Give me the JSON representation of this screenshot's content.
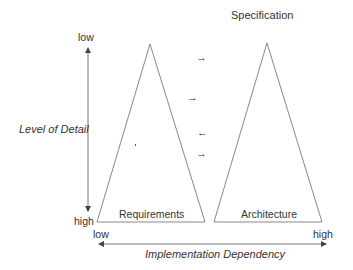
{
  "diagram": {
    "title": "Specification",
    "y_axis": {
      "label": "Level of Detail",
      "top_label": "low",
      "bottom_label": "high"
    },
    "x_axis": {
      "label": "Implementation Dependency",
      "left_label": "low",
      "right_label": "high"
    },
    "triangles": [
      {
        "label": "Requirements"
      },
      {
        "label": "Architecture"
      }
    ],
    "arrows": [
      {
        "glyph": "→",
        "direction": "right"
      },
      {
        "glyph": "→",
        "direction": "right"
      },
      {
        "glyph": "←",
        "direction": "left"
      },
      {
        "glyph": "→",
        "direction": "right"
      }
    ],
    "line_color": "#777777",
    "text_color": "#333333"
  }
}
